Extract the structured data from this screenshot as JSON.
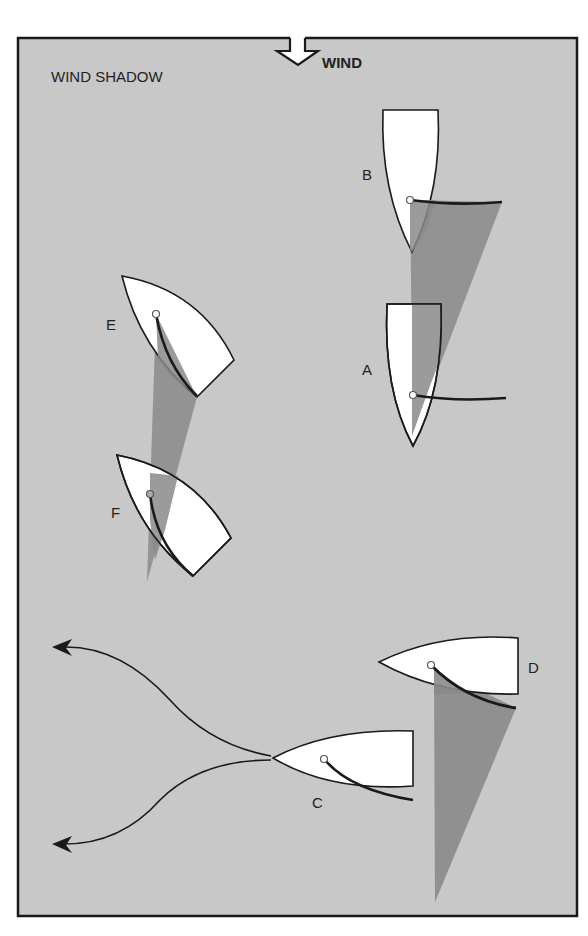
{
  "title": "WIND SHADOW",
  "wind_label": "WIND",
  "colors": {
    "background": "#c8c8c8",
    "frame": "#1a1a1a",
    "hull": "#ffffff",
    "shadow": "#8a8a8a",
    "line": "#1a1a1a"
  },
  "boats": [
    {
      "id": "A",
      "label": "A"
    },
    {
      "id": "B",
      "label": "B"
    },
    {
      "id": "C",
      "label": "C"
    },
    {
      "id": "D",
      "label": "D"
    },
    {
      "id": "E",
      "label": "E"
    },
    {
      "id": "F",
      "label": "F"
    }
  ]
}
